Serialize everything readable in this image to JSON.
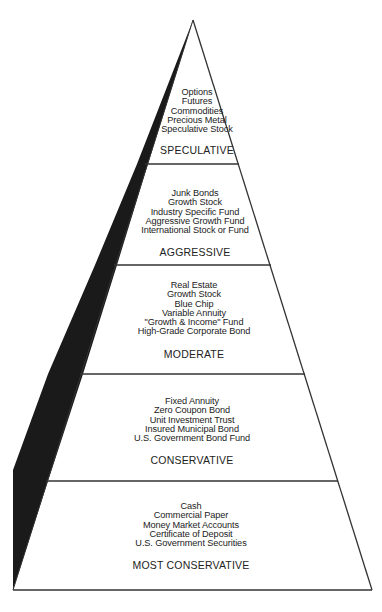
{
  "diagram": {
    "type": "investment-risk-pyramid",
    "colors": {
      "line": "#333333",
      "band": "#1a1a1a",
      "text": "#222222",
      "background": "#ffffff"
    },
    "tiers": [
      {
        "label": "SPECULATIVE",
        "items": [
          "Options",
          "Futures",
          "Commodities",
          "Precious Metal",
          "Speculative Stock"
        ]
      },
      {
        "label": "AGGRESSIVE",
        "items": [
          "Junk Bonds",
          "Growth Stock",
          "Industry Specific Fund",
          "Aggressive Growth Fund",
          "International Stock or Fund"
        ]
      },
      {
        "label": "MODERATE",
        "items": [
          "Real Estate",
          "Growth Stock",
          "Blue Chip",
          "Variable Annuity",
          "\"Growth & Income\" Fund",
          "High-Grade Corporate Bond"
        ]
      },
      {
        "label": "CONSERVATIVE",
        "items": [
          "Fixed Annuity",
          "Zero Coupon Bond",
          "Unit Investment Trust",
          "Insured Municipal Bond",
          "U.S. Government Bond Fund"
        ]
      },
      {
        "label": "MOST CONSERVATIVE",
        "items": [
          "Cash",
          "Commercial Paper",
          "Money Market Accounts",
          "Certificate of Deposit",
          "U.S. Government Securities"
        ]
      }
    ]
  }
}
